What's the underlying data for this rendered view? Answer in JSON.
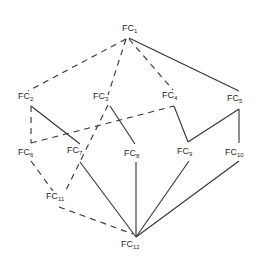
{
  "diagram": {
    "type": "graph",
    "nodes": [
      {
        "id": "FC1",
        "prefix": "FC",
        "sub": "1",
        "x": 122,
        "y": 31
      },
      {
        "id": "FC2",
        "prefix": "FC",
        "sub": "2",
        "x": 18,
        "y": 99
      },
      {
        "id": "FC3",
        "prefix": "FC",
        "sub": "3",
        "x": 93,
        "y": 99
      },
      {
        "id": "FC4",
        "prefix": "FC",
        "sub": "4",
        "x": 162,
        "y": 98
      },
      {
        "id": "FC5",
        "prefix": "FC",
        "sub": "5",
        "x": 227,
        "y": 101
      },
      {
        "id": "FC6",
        "prefix": "FC",
        "sub": "6",
        "x": 18,
        "y": 155
      },
      {
        "id": "FC7",
        "prefix": "FC",
        "sub": "7",
        "x": 67,
        "y": 153
      },
      {
        "id": "FC8",
        "prefix": "FC",
        "sub": "8",
        "x": 124,
        "y": 156
      },
      {
        "id": "FC9",
        "prefix": "FC",
        "sub": "9",
        "x": 177,
        "y": 154
      },
      {
        "id": "FC10",
        "prefix": "FC",
        "sub": "10",
        "x": 225,
        "y": 155
      },
      {
        "id": "FC11",
        "prefix": "FC",
        "sub": "11",
        "x": 46,
        "y": 199
      },
      {
        "id": "FC12",
        "prefix": "FC",
        "sub": "12",
        "x": 121,
        "y": 247
      }
    ],
    "edges": [
      {
        "from": "FC1",
        "to": "FC2",
        "style": "dashed",
        "points": [
          [
            126,
            39
          ],
          [
            28,
            91
          ]
        ]
      },
      {
        "from": "FC1",
        "to": "FC3",
        "style": "dashed",
        "points": [
          [
            126,
            39
          ],
          [
            108,
            95
          ]
        ]
      },
      {
        "from": "FC1",
        "to": "FC4",
        "style": "dashed",
        "points": [
          [
            129,
            39
          ],
          [
            173,
            90
          ]
        ]
      },
      {
        "from": "FC1",
        "to": "FC5",
        "style": "solid",
        "points": [
          [
            129,
            38
          ],
          [
            239,
            91
          ]
        ]
      },
      {
        "from": "FC2",
        "to": "FC7",
        "style": "solid",
        "points": [
          [
            31,
            106
          ],
          [
            80,
            144
          ]
        ]
      },
      {
        "from": "FC2",
        "to": "FC6",
        "style": "dashed",
        "points": [
          [
            31,
            106
          ],
          [
            31,
            143
          ]
        ]
      },
      {
        "from": "FC6",
        "to": "FC4",
        "style": "dashed",
        "points": [
          [
            31,
            143
          ],
          [
            174,
            106
          ]
        ]
      },
      {
        "from": "FC3",
        "to": "FC8",
        "style": "solid",
        "points": [
          [
            110,
            106
          ],
          [
            135,
            144
          ]
        ]
      },
      {
        "from": "FC3",
        "to": "FC11",
        "style": "dashed",
        "points": [
          [
            108,
            105
          ],
          [
            66,
            190
          ]
        ]
      },
      {
        "from": "FC4",
        "to": "FC9",
        "style": "solid",
        "points": [
          [
            174,
            106
          ],
          [
            188,
            142
          ]
        ]
      },
      {
        "from": "FC9",
        "to": "FC5",
        "style": "solid",
        "points": [
          [
            188,
            142
          ],
          [
            239,
            109
          ]
        ]
      },
      {
        "from": "FC5",
        "to": "FC10",
        "style": "solid",
        "points": [
          [
            239,
            109
          ],
          [
            239,
            143
          ]
        ]
      },
      {
        "from": "FC6",
        "to": "FC11",
        "style": "dashed",
        "points": [
          [
            31,
            161
          ],
          [
            53,
            191
          ]
        ]
      },
      {
        "from": "FC11",
        "to": "FC12",
        "style": "dashed",
        "points": [
          [
            59,
            207
          ],
          [
            133,
            234
          ]
        ]
      },
      {
        "from": "FC7",
        "to": "FC12",
        "style": "solid",
        "points": [
          [
            80,
            162
          ],
          [
            136,
            237
          ]
        ]
      },
      {
        "from": "FC8",
        "to": "FC12",
        "style": "solid",
        "points": [
          [
            136,
            162
          ],
          [
            136,
            237
          ]
        ]
      },
      {
        "from": "FC9",
        "to": "FC12",
        "style": "solid",
        "points": [
          [
            189,
            161
          ],
          [
            136,
            237
          ]
        ]
      },
      {
        "from": "FC10",
        "to": "FC12",
        "style": "solid",
        "points": [
          [
            239,
            161
          ],
          [
            136,
            237
          ]
        ]
      }
    ]
  }
}
